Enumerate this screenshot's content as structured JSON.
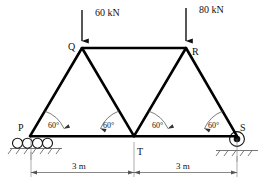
{
  "figure": {
    "kind": "truss-free-body-diagram",
    "background_color": "#ffffff",
    "line_color": "#000000"
  },
  "loads": [
    {
      "id": "load-left",
      "label": "60 kN",
      "at_node": "Q",
      "direction": "down"
    },
    {
      "id": "load-right",
      "label": "80 kN",
      "at_node": "R",
      "direction": "down"
    }
  ],
  "nodes": [
    {
      "id": "P",
      "label": "P",
      "role": "roller-support"
    },
    {
      "id": "Q",
      "label": "Q",
      "role": "top-chord-joint"
    },
    {
      "id": "R",
      "label": "R",
      "role": "top-chord-joint"
    },
    {
      "id": "S",
      "label": "S",
      "role": "pin-support"
    },
    {
      "id": "T",
      "label": "T",
      "role": "bottom-chord-joint"
    }
  ],
  "angles": [
    {
      "id": "angle-1",
      "label": "60°",
      "at_node": "P"
    },
    {
      "id": "angle-2",
      "label": "60°",
      "at_node": "T"
    },
    {
      "id": "angle-3",
      "label": "60°",
      "at_node": "T"
    },
    {
      "id": "angle-4",
      "label": "60°",
      "at_node": "S"
    }
  ],
  "dimensions": [
    {
      "id": "dim-left",
      "label": "3 m",
      "from": "P",
      "to": "T"
    },
    {
      "id": "dim-right",
      "label": "3 m",
      "from": "T",
      "to": "S"
    }
  ],
  "members": [
    {
      "from": "P",
      "to": "Q"
    },
    {
      "from": "Q",
      "to": "T"
    },
    {
      "from": "T",
      "to": "R"
    },
    {
      "from": "R",
      "to": "S"
    },
    {
      "from": "Q",
      "to": "R"
    },
    {
      "from": "P",
      "to": "T"
    },
    {
      "from": "T",
      "to": "S"
    }
  ]
}
